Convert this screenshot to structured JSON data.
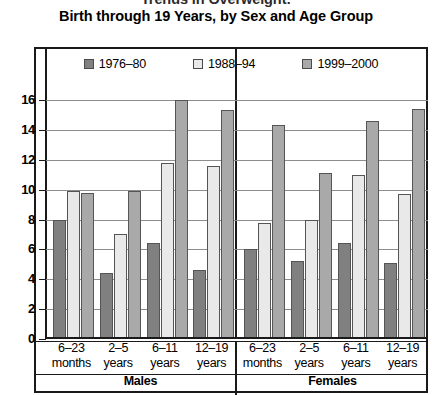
{
  "title": {
    "line1": "Trends in Overweight:",
    "line2": "Birth through 19 Years, by Sex and Age Group"
  },
  "legend": {
    "position": "top-center",
    "items": [
      {
        "label": "1976–80",
        "color": "#808080"
      },
      {
        "label": "1988–94",
        "color": "#e9e9e9"
      },
      {
        "label": "1999–2000",
        "color": "#a9a9a9"
      }
    ]
  },
  "axes": {
    "ylabel": "% Overweight",
    "yticks": [
      "0",
      "2",
      "4",
      "6",
      "8",
      "10",
      "12",
      "14",
      "16"
    ],
    "groups": [
      "Males",
      "Females"
    ],
    "categories": [
      {
        "line1": "6–23",
        "line2": "months"
      },
      {
        "line1": "2–5",
        "line2": "years"
      },
      {
        "line1": "6–11",
        "line2": "years"
      },
      {
        "line1": "12–19",
        "line2": "years"
      }
    ]
  },
  "chart_data": {
    "type": "bar",
    "title": "Trends in Overweight: Birth through 19 Years, by Sex and Age Group",
    "xlabel": "",
    "ylabel": "% Overweight",
    "ylim": [
      0,
      16
    ],
    "ytick_step": 2,
    "grid": true,
    "legend_position": "top-center",
    "groups": [
      "Males",
      "Females"
    ],
    "categories": [
      "6–23 months",
      "2–5 years",
      "6–11 years",
      "12–19 years"
    ],
    "series": [
      {
        "name": "1976–80",
        "color": "#808080",
        "values": {
          "Males": [
            8.0,
            4.4,
            6.4,
            4.6
          ],
          "Females": [
            6.0,
            5.2,
            6.4,
            5.1
          ]
        }
      },
      {
        "name": "1988–94",
        "color": "#e9e9e9",
        "values": {
          "Males": [
            9.9,
            7.0,
            11.8,
            11.6
          ],
          "Females": [
            7.8,
            8.0,
            11.0,
            9.7
          ]
        }
      },
      {
        "name": "1999–2000",
        "color": "#a9a9a9",
        "values": {
          "Males": [
            9.8,
            9.9,
            16.0,
            15.3
          ],
          "Females": [
            14.3,
            11.1,
            14.6,
            15.4
          ]
        }
      }
    ]
  }
}
